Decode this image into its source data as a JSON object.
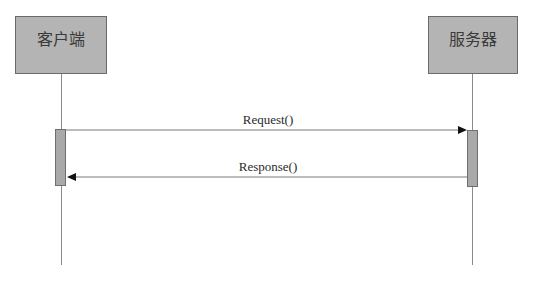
{
  "diagram": {
    "type": "sequence",
    "participants": [
      {
        "id": "client",
        "label": "客户端"
      },
      {
        "id": "server",
        "label": "服务器"
      }
    ],
    "messages": [
      {
        "from": "client",
        "to": "server",
        "label": "Request()",
        "kind": "synchronous-call"
      },
      {
        "from": "server",
        "to": "client",
        "label": "Response()",
        "kind": "return"
      }
    ],
    "colors": {
      "participant_fill": "#b4b4b4",
      "participant_border": "#6a6a6a",
      "activation_fill": "#a9a9a9",
      "line": "#8a8a8a",
      "arrowhead": "#111111"
    }
  }
}
